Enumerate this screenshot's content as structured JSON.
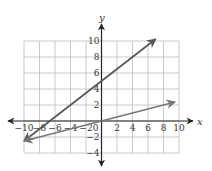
{
  "chart_data": {
    "type": "line",
    "title": "",
    "xlabel": "x",
    "ylabel": "y",
    "xlim": [
      -10,
      10
    ],
    "ylim": [
      -4,
      10
    ],
    "grid": true,
    "grid_step": 2,
    "x_ticks": [
      "-10",
      "-8",
      "-6",
      "-4",
      "-2",
      "0",
      "2",
      "4",
      "6",
      "8",
      "10"
    ],
    "y_ticks": [
      "10",
      "8",
      "6",
      "4",
      "2",
      "-2",
      "-4"
    ],
    "series": [
      {
        "name": "line-1",
        "equation": "y = 0.75x + 5",
        "x": [
          -10,
          7
        ],
        "values": [
          -2.5,
          10.25
        ],
        "color": "#555555"
      },
      {
        "name": "line-2",
        "equation": "y = 0.25x",
        "x": [
          -10,
          9.5
        ],
        "values": [
          -2.5,
          2.375
        ],
        "color": "#777777"
      }
    ],
    "colors": {
      "grid": "#bdbdbd",
      "axis": "#222222"
    }
  }
}
